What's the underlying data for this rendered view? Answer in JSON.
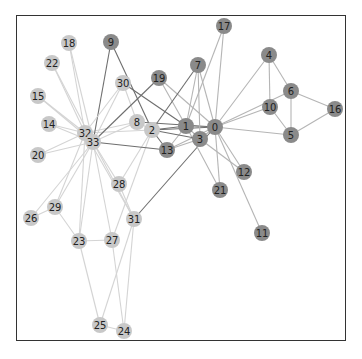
{
  "diagram": {
    "type": "network-graph",
    "frame": {
      "x": 16,
      "y": 15,
      "width": 330,
      "height": 326
    },
    "colors": {
      "faction_a_node": "#c8c8c8",
      "faction_b_node": "#8a8a8a",
      "edge_light": "#d4d4d4",
      "edge_mid": "#b5b5b5",
      "edge_dark": "#6e6e6e",
      "label": "#222222"
    },
    "node_radius": 8,
    "nodes": [
      {
        "id": "0",
        "x": 215,
        "y": 127,
        "group": "b"
      },
      {
        "id": "1",
        "x": 186,
        "y": 126,
        "group": "b"
      },
      {
        "id": "2",
        "x": 152,
        "y": 130,
        "group": "a"
      },
      {
        "id": "3",
        "x": 200,
        "y": 139,
        "group": "b"
      },
      {
        "id": "4",
        "x": 269,
        "y": 55,
        "group": "b"
      },
      {
        "id": "5",
        "x": 291,
        "y": 135,
        "group": "b"
      },
      {
        "id": "6",
        "x": 291,
        "y": 91,
        "group": "b"
      },
      {
        "id": "7",
        "x": 198,
        "y": 65,
        "group": "b"
      },
      {
        "id": "8",
        "x": 137,
        "y": 122,
        "group": "a"
      },
      {
        "id": "9",
        "x": 111,
        "y": 42,
        "group": "b"
      },
      {
        "id": "10",
        "x": 270,
        "y": 107,
        "group": "b"
      },
      {
        "id": "11",
        "x": 262,
        "y": 233,
        "group": "b"
      },
      {
        "id": "12",
        "x": 244,
        "y": 172,
        "group": "b"
      },
      {
        "id": "13",
        "x": 167,
        "y": 150,
        "group": "b"
      },
      {
        "id": "14",
        "x": 49,
        "y": 124,
        "group": "a"
      },
      {
        "id": "15",
        "x": 38,
        "y": 96,
        "group": "a"
      },
      {
        "id": "16",
        "x": 335,
        "y": 109,
        "group": "b"
      },
      {
        "id": "17",
        "x": 224,
        "y": 26,
        "group": "b"
      },
      {
        "id": "18",
        "x": 69,
        "y": 43,
        "group": "a"
      },
      {
        "id": "19",
        "x": 159,
        "y": 78,
        "group": "b"
      },
      {
        "id": "20",
        "x": 38,
        "y": 155,
        "group": "a"
      },
      {
        "id": "21",
        "x": 220,
        "y": 190,
        "group": "b"
      },
      {
        "id": "22",
        "x": 52,
        "y": 63,
        "group": "a"
      },
      {
        "id": "23",
        "x": 79,
        "y": 241,
        "group": "a"
      },
      {
        "id": "24",
        "x": 124,
        "y": 331,
        "group": "a"
      },
      {
        "id": "25",
        "x": 100,
        "y": 325,
        "group": "a"
      },
      {
        "id": "26",
        "x": 31,
        "y": 218,
        "group": "a"
      },
      {
        "id": "27",
        "x": 112,
        "y": 240,
        "group": "a"
      },
      {
        "id": "28",
        "x": 119,
        "y": 184,
        "group": "a"
      },
      {
        "id": "29",
        "x": 55,
        "y": 207,
        "group": "a"
      },
      {
        "id": "30",
        "x": 123,
        "y": 83,
        "group": "a"
      },
      {
        "id": "31",
        "x": 134,
        "y": 219,
        "group": "a"
      },
      {
        "id": "32",
        "x": 85,
        "y": 133,
        "group": "a"
      },
      {
        "id": "33",
        "x": 93,
        "y": 142,
        "group": "a"
      }
    ],
    "edges": [
      [
        "0",
        "1"
      ],
      [
        "0",
        "2"
      ],
      [
        "0",
        "3"
      ],
      [
        "0",
        "4"
      ],
      [
        "0",
        "5"
      ],
      [
        "0",
        "6"
      ],
      [
        "0",
        "7"
      ],
      [
        "0",
        "8"
      ],
      [
        "0",
        "10"
      ],
      [
        "0",
        "11"
      ],
      [
        "0",
        "12"
      ],
      [
        "0",
        "13"
      ],
      [
        "0",
        "17"
      ],
      [
        "0",
        "19"
      ],
      [
        "0",
        "21"
      ],
      [
        "0",
        "31"
      ],
      [
        "1",
        "2"
      ],
      [
        "1",
        "3"
      ],
      [
        "1",
        "7"
      ],
      [
        "1",
        "13"
      ],
      [
        "1",
        "17"
      ],
      [
        "1",
        "19"
      ],
      [
        "1",
        "21"
      ],
      [
        "1",
        "30"
      ],
      [
        "2",
        "3"
      ],
      [
        "2",
        "7"
      ],
      [
        "2",
        "8"
      ],
      [
        "2",
        "9"
      ],
      [
        "2",
        "13"
      ],
      [
        "2",
        "27"
      ],
      [
        "2",
        "28"
      ],
      [
        "2",
        "32"
      ],
      [
        "3",
        "7"
      ],
      [
        "3",
        "12"
      ],
      [
        "3",
        "13"
      ],
      [
        "4",
        "6"
      ],
      [
        "4",
        "10"
      ],
      [
        "5",
        "6"
      ],
      [
        "5",
        "10"
      ],
      [
        "5",
        "16"
      ],
      [
        "6",
        "16"
      ],
      [
        "8",
        "30"
      ],
      [
        "8",
        "32"
      ],
      [
        "8",
        "33"
      ],
      [
        "9",
        "33"
      ],
      [
        "13",
        "33"
      ],
      [
        "14",
        "32"
      ],
      [
        "14",
        "33"
      ],
      [
        "15",
        "32"
      ],
      [
        "15",
        "33"
      ],
      [
        "18",
        "32"
      ],
      [
        "18",
        "33"
      ],
      [
        "19",
        "33"
      ],
      [
        "20",
        "32"
      ],
      [
        "20",
        "33"
      ],
      [
        "22",
        "32"
      ],
      [
        "22",
        "33"
      ],
      [
        "23",
        "25"
      ],
      [
        "23",
        "27"
      ],
      [
        "23",
        "29"
      ],
      [
        "23",
        "32"
      ],
      [
        "23",
        "33"
      ],
      [
        "24",
        "25"
      ],
      [
        "24",
        "27"
      ],
      [
        "24",
        "31"
      ],
      [
        "25",
        "31"
      ],
      [
        "26",
        "29"
      ],
      [
        "26",
        "33"
      ],
      [
        "27",
        "33"
      ],
      [
        "28",
        "31"
      ],
      [
        "28",
        "33"
      ],
      [
        "29",
        "32"
      ],
      [
        "29",
        "33"
      ],
      [
        "30",
        "32"
      ],
      [
        "30",
        "33"
      ],
      [
        "31",
        "32"
      ],
      [
        "31",
        "33"
      ],
      [
        "32",
        "33"
      ]
    ]
  }
}
